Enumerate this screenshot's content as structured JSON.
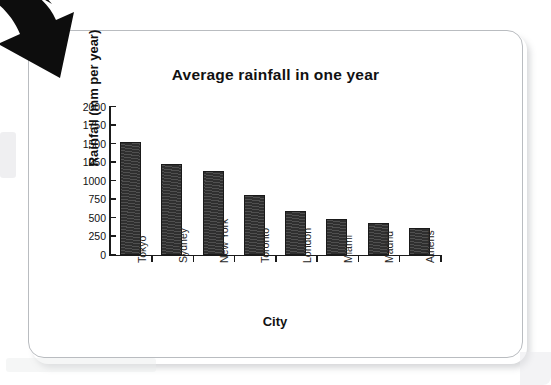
{
  "page": {
    "decoration_arrow": "curved-down-left-arrow"
  },
  "chart_data": {
    "type": "bar",
    "title": "Average rainfall in one year",
    "xlabel": "City",
    "ylabel": "Rainfall (mm per year)",
    "categories": [
      "Tokyo",
      "Sydney",
      "New York",
      "Toronto",
      "London",
      "Miami",
      "Madrid",
      "Athens"
    ],
    "values": [
      1520,
      1230,
      1125,
      810,
      595,
      485,
      425,
      365
    ],
    "ylim": [
      0,
      2000
    ],
    "yticks": [
      0,
      250,
      500,
      750,
      1000,
      1250,
      1500,
      1750,
      2000
    ],
    "ytick_labels": [
      "0",
      "250",
      "500",
      "750",
      "1000",
      "1250",
      "1500",
      "1750",
      "2000"
    ],
    "grid": false,
    "legend": null,
    "bar_color": "#2f2f2f",
    "axis_color": "#1b1b1b",
    "background": "#ffffff"
  }
}
